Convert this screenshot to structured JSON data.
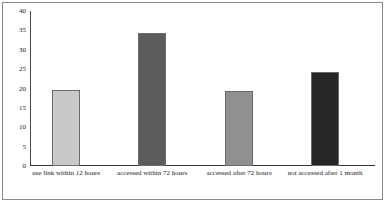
{
  "chart_data": {
    "type": "bar",
    "title": "",
    "subtitle": "",
    "xlabel": "",
    "ylabel": "",
    "categories": [
      "use link within 12 hours",
      "accessed within 72 hours",
      "accessed after 72 hours",
      "not accessed after 1 month"
    ],
    "values": [
      19.5,
      34.3,
      19.3,
      24.2
    ],
    "ylim": [
      0,
      40
    ],
    "yticks": [
      0,
      5,
      10,
      15,
      20,
      25,
      30,
      35,
      40
    ],
    "ytick_labels": [
      "0",
      "5",
      "10",
      "15",
      "20",
      "25",
      "30",
      "35",
      "40"
    ],
    "grid": false,
    "legend": false,
    "legend_position": "none",
    "bar_colors": [
      "#c9c9c9",
      "#5c5c5c",
      "#909090",
      "#262626"
    ],
    "bar_edge_color": "#6b6b6b",
    "axis_color": "#333333",
    "background_color": "#ffffff",
    "frame_color": "#8a8a8a"
  }
}
